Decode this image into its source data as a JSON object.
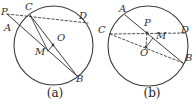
{
  "figure": {
    "background": "#ffffff",
    "stroke_color": "#3b3b3b",
    "panels": [
      {
        "id": "a",
        "caption": "(a)",
        "caption_pos": {
          "x": 55,
          "y": 88
        },
        "circle": {
          "cx": 53.5,
          "cy": 45.5,
          "r": 39.5
        },
        "dots": [
          {
            "name": "center-O-dot",
            "x": 53,
            "y": 45
          }
        ],
        "segments": [
          {
            "name": "secant-P-C-D",
            "x1": 7,
            "y1": 14,
            "x2": 88,
            "y2": 23,
            "dashed": true,
            "weight": 0.9
          },
          {
            "name": "secant-P-A-B",
            "x1": 7,
            "y1": 14,
            "x2": 77,
            "y2": 76,
            "dashed": false,
            "weight": 1.0
          },
          {
            "name": "chord-C-B",
            "x1": 30,
            "y1": 15,
            "x2": 77,
            "y2": 76,
            "dashed": false,
            "weight": 1.0
          },
          {
            "name": "segment-C-M",
            "x1": 30,
            "y1": 15,
            "x2": 48,
            "y2": 51,
            "dashed": false,
            "weight": 0.9
          },
          {
            "name": "segment-O-M",
            "x1": 53,
            "y1": 45,
            "x2": 48,
            "y2": 51,
            "dashed": false,
            "weight": 0.9
          }
        ],
        "labels": [
          {
            "text": "P",
            "x": 1,
            "y": 8
          },
          {
            "text": "C",
            "x": 25,
            "y": 3
          },
          {
            "text": "D",
            "x": 79,
            "y": 12
          },
          {
            "text": "A",
            "x": 4,
            "y": 24
          },
          {
            "text": "O",
            "x": 57,
            "y": 34
          },
          {
            "text": "M",
            "x": 35,
            "y": 48
          },
          {
            "text": "B",
            "x": 76,
            "y": 75
          }
        ]
      },
      {
        "id": "b",
        "caption": "(b)",
        "caption_pos": {
          "x": 152,
          "y": 88
        },
        "circle": {
          "cx": 148,
          "cy": 46,
          "r": 40
        },
        "dots": [
          {
            "name": "point-P-dot",
            "x": 147,
            "y": 33
          },
          {
            "name": "center-O-dot",
            "x": 146,
            "y": 47
          }
        ],
        "segments": [
          {
            "name": "chord-C-D",
            "x1": 110,
            "y1": 34,
            "x2": 186,
            "y2": 33,
            "dashed": true,
            "weight": 0.9
          },
          {
            "name": "chord-A-B",
            "x1": 125,
            "y1": 15,
            "x2": 183,
            "y2": 63,
            "dashed": false,
            "weight": 1.0
          },
          {
            "name": "chord-C-B",
            "x1": 110,
            "y1": 34,
            "x2": 183,
            "y2": 63,
            "dashed": true,
            "weight": 0.9
          },
          {
            "name": "segment-P-O",
            "x1": 147,
            "y1": 33,
            "x2": 146,
            "y2": 47,
            "dashed": true,
            "weight": 0.9
          },
          {
            "name": "segment-O-M",
            "x1": 146,
            "y1": 47,
            "x2": 153,
            "y2": 38,
            "dashed": false,
            "weight": 0.9
          }
        ],
        "labels": [
          {
            "text": "A",
            "x": 119,
            "y": 5
          },
          {
            "text": "C",
            "x": 98,
            "y": 26
          },
          {
            "text": "P",
            "x": 144,
            "y": 19
          },
          {
            "text": "M",
            "x": 156,
            "y": 32
          },
          {
            "text": "D",
            "x": 181,
            "y": 26
          },
          {
            "text": "O",
            "x": 140,
            "y": 49
          },
          {
            "text": "B",
            "x": 185,
            "y": 54
          }
        ]
      }
    ]
  }
}
